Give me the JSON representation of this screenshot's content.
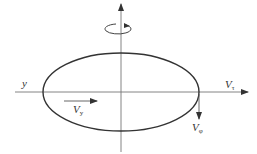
{
  "diagram": {
    "type": "ellipse-velocity-diagram",
    "colors": {
      "stroke": "#333333",
      "axis": "#666666",
      "background": "#ffffff"
    },
    "labels": {
      "y_axis": "y",
      "v_tau_main": "V",
      "v_tau_sub": "τ",
      "v_y_main": "V",
      "v_y_sub": "y",
      "v_phi_main": "V",
      "v_phi_sub": "φ"
    },
    "icons": [
      "rotation-arrow-icon"
    ]
  }
}
